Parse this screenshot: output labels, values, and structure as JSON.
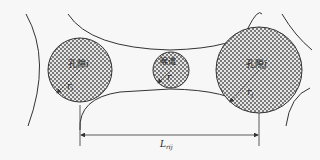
{
  "diagram": {
    "type": "pore-network schematic",
    "colors": {
      "background": "#f7f7f7",
      "outline": "#333333",
      "checker_dark": "#7a7a7a",
      "checker_light": "#e8e8e8"
    },
    "pore_i": {
      "label": "孔隙",
      "index": "i",
      "radius_symbol": "r",
      "radius_sub": "i"
    },
    "throat": {
      "label": "喉道",
      "radius_symbol": "r"
    },
    "pore_j": {
      "label": "孔隙",
      "index": "j",
      "radius_symbol": "r",
      "radius_sub": "j"
    },
    "distance": {
      "symbol": "L",
      "sub": "rij"
    }
  }
}
